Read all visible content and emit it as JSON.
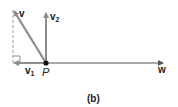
{
  "figure": {
    "caption": "(b)",
    "point_label": "P",
    "vectors": {
      "v": {
        "label": "v",
        "subscript": ""
      },
      "v1": {
        "label": "v",
        "subscript": "1"
      },
      "v2": {
        "label": "v",
        "subscript": "2"
      },
      "w": {
        "label": "w",
        "subscript": ""
      }
    },
    "colors": {
      "vector": "#8c8c8c",
      "w_line": "#555555",
      "dashed": "#9a9a9a",
      "point": "#111111",
      "text": "#222222"
    }
  }
}
